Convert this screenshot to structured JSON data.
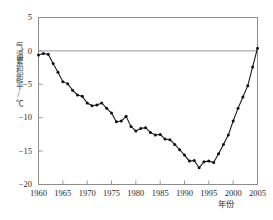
{
  "chart_data": {
    "type": "line",
    "title": "",
    "subtitle": "",
    "xlabel": "年份",
    "ylabel": "气温累积距平/℃",
    "xlim": [
      1960,
      2005
    ],
    "ylim": [
      -20,
      5
    ],
    "xticks": [
      "1960",
      "1965",
      "1970",
      "1975",
      "1980",
      "1985",
      "1990",
      "1995",
      "2000",
      "2005"
    ],
    "xtick_values": [
      1960,
      1965,
      1970,
      1975,
      1980,
      1985,
      1990,
      1995,
      2000,
      2005
    ],
    "yticks": [
      "5",
      "0",
      "−5",
      "−10",
      "−15",
      "−20"
    ],
    "ytick_values": [
      5,
      0,
      -5,
      -10,
      -15,
      -20
    ],
    "grid": false,
    "legend": "none",
    "zero_line": 0,
    "marker": "filled-circle",
    "line_color": "#111111",
    "marker_color": "#111111",
    "axis_color": "#8d8d8d",
    "zero_line_color": "#9a9a9a",
    "x": [
      1960,
      1961,
      1962,
      1963,
      1964,
      1965,
      1966,
      1967,
      1968,
      1969,
      1970,
      1971,
      1972,
      1973,
      1974,
      1975,
      1976,
      1977,
      1978,
      1979,
      1980,
      1981,
      1982,
      1983,
      1984,
      1985,
      1986,
      1987,
      1988,
      1989,
      1990,
      1991,
      1992,
      1993,
      1994,
      1995,
      1996,
      1997,
      1998,
      1999,
      2000,
      2001,
      2002,
      2003,
      2004,
      2005
    ],
    "values": [
      -0.6,
      -0.4,
      -0.5,
      -1.9,
      -3.2,
      -4.6,
      -4.9,
      -5.9,
      -6.6,
      -6.8,
      -7.8,
      -8.2,
      -8.1,
      -7.8,
      -8.6,
      -9.3,
      -10.6,
      -10.5,
      -9.8,
      -11.3,
      -12.0,
      -11.6,
      -11.5,
      -12.2,
      -12.6,
      -12.5,
      -13.2,
      -13.3,
      -14.0,
      -14.8,
      -15.6,
      -16.5,
      -16.4,
      -17.5,
      -16.6,
      -16.5,
      -16.7,
      -15.4,
      -14.0,
      -12.6,
      -10.5,
      -8.6,
      -6.9,
      -5.2,
      -2.4,
      0.4
    ]
  }
}
